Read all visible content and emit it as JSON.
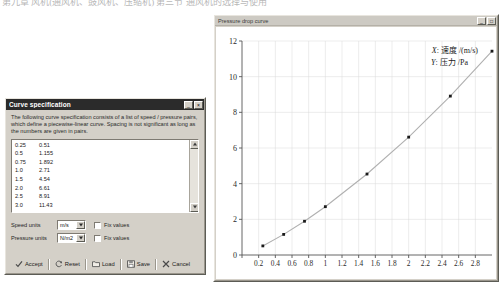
{
  "page": {
    "top_scan_text": "第九章 风机(通风机、鼓风机、压缩机)    第三节 通风机的选择与使用"
  },
  "curve_dialog": {
    "title": "Curve specification",
    "description": "The following curve specification consists of a list of speed / pressure pairs, which define a piecewise-linear curve.  Spacing is not significant as long as the numbers are given in pairs.",
    "pairs": [
      {
        "speed": "0.25",
        "pressure": "0.51"
      },
      {
        "speed": "0.5",
        "pressure": "1.155"
      },
      {
        "speed": "0.75",
        "pressure": "1.892"
      },
      {
        "speed": "1.0",
        "pressure": "2.71"
      },
      {
        "speed": "1.5",
        "pressure": "4.54"
      },
      {
        "speed": "2.0",
        "pressure": "6.61"
      },
      {
        "speed": "2.5",
        "pressure": "8.91"
      },
      {
        "speed": "3.0",
        "pressure": "11.43"
      }
    ],
    "units": {
      "speed_label": "Speed units",
      "speed_value": "m/s",
      "speed_fix_label": "Fix values",
      "pressure_label": "Pressure units",
      "pressure_value": "N/m2",
      "pressure_fix_label": "Fix values"
    },
    "buttons": {
      "accept": "Accept",
      "reset": "Reset",
      "load": "Load",
      "save": "Save",
      "cancel": "Cancel"
    },
    "titlebar_buttons": {
      "minimize": "_",
      "maximize": "□",
      "close": "×"
    }
  },
  "chart_window": {
    "title": "Pressure drop curve",
    "titlebar_buttons": {
      "minimize": "_",
      "maximize": "□"
    }
  },
  "chart_data": {
    "type": "scatter",
    "title": "Pressure drop curve",
    "annotation": {
      "x_line": "X: 速度 /(m/s)",
      "y_line": "Y: 压力 /Pa",
      "x_symbol": "X",
      "x_rest": ": 速度 /(m/s)",
      "y_symbol": "Y",
      "y_rest": ": 压力 /Pa"
    },
    "xlabel": "",
    "ylabel": "",
    "x": [
      0.25,
      0.5,
      0.75,
      1.0,
      1.5,
      2.0,
      2.5,
      3.0
    ],
    "values": [
      0.51,
      1.155,
      1.892,
      2.71,
      4.54,
      6.61,
      8.91,
      11.43
    ],
    "xlim": [
      0,
      3.0
    ],
    "ylim": [
      0,
      12
    ],
    "xticks": [
      "0",
      "0.2",
      "0.4",
      "0.6",
      "0.8",
      "1",
      "1.2",
      "1.4",
      "1.6",
      "1.8",
      "2",
      "2.2",
      "2.4",
      "2.6",
      "2.8"
    ],
    "xtick_values": [
      0,
      0.2,
      0.4,
      0.6,
      0.8,
      1.0,
      1.2,
      1.4,
      1.6,
      1.8,
      2.0,
      2.2,
      2.4,
      2.6,
      2.8
    ],
    "yticks": [
      "0",
      "2",
      "4",
      "6",
      "8",
      "10",
      "12"
    ],
    "ytick_values": [
      0,
      2,
      4,
      6,
      8,
      10,
      12
    ],
    "grid": true,
    "legend": "none",
    "curve_color": "#b0b0b0",
    "marker_color": "#1a1a1a",
    "grid_color": "#d8d8d8"
  }
}
